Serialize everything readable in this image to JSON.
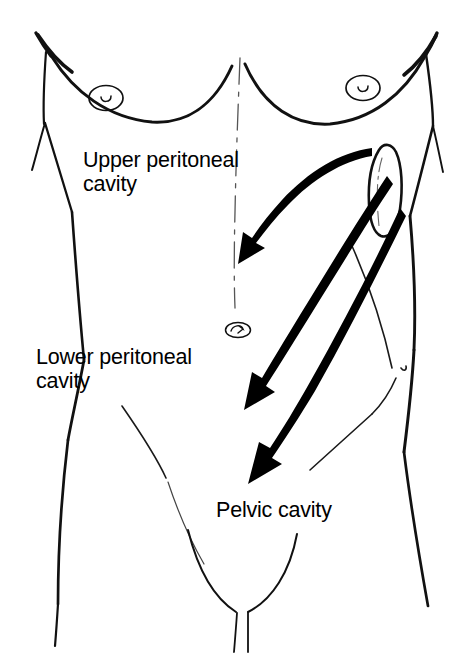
{
  "figure": {
    "background_color": "#ffffff",
    "ink_color": "#000000",
    "width": 469,
    "height": 671
  },
  "labels": {
    "upper": "Upper peritoneal\ncavity",
    "lower": "Lower peritoneal\ncavity",
    "pelvic": "Pelvic cavity"
  },
  "annotations": {
    "arrow_1": {
      "name": "arrow-to-upper-peritoneal-cavity",
      "from": "right upper quadrant organ",
      "to": "upper peritoneal cavity",
      "style": "curved solid black arrow"
    },
    "arrow_2": {
      "name": "arrow-to-lower-peritoneal-cavity",
      "from": "right upper quadrant organ",
      "to": "lower peritoneal cavity",
      "style": "curved solid black arrow"
    },
    "arrow_3": {
      "name": "arrow-to-pelvic-cavity",
      "from": "right flank",
      "to": "pelvic cavity",
      "style": "curved solid black arrow"
    }
  },
  "anatomy": {
    "parts": [
      "torso-outline",
      "left-arm",
      "right-arm",
      "left-pectoral-contour",
      "right-pectoral-contour",
      "left-nipple",
      "right-nipple",
      "umbilicus",
      "linea-alba-midline",
      "right-flank-contour",
      "left-inguinal-contour",
      "right-inguinal-contour",
      "groin-cleft",
      "kidney-shaped-organ"
    ]
  },
  "icons": {
    "nipple": "nipple-icon",
    "navel": "navel-icon",
    "organ": "kidney-icon",
    "arrow": "arrow-icon"
  }
}
